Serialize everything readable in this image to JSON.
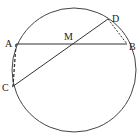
{
  "diagram": {
    "type": "geometry",
    "circle": {
      "cx": 74,
      "cy": 70,
      "r": 62
    },
    "points": {
      "A": {
        "label": "A",
        "x": 16,
        "y": 44
      },
      "B": {
        "label": "B",
        "x": 127,
        "y": 44
      },
      "C": {
        "label": "C",
        "x": 12,
        "y": 87
      },
      "D": {
        "label": "D",
        "x": 108,
        "y": 19
      },
      "M": {
        "label": "M",
        "x": 76,
        "y": 44
      }
    },
    "solid_segments": [
      [
        "A",
        "B"
      ],
      [
        "C",
        "D"
      ]
    ],
    "dashed_segments": [
      [
        "A",
        "C"
      ],
      [
        "D",
        "B"
      ]
    ],
    "stroke_color": "#333333"
  }
}
